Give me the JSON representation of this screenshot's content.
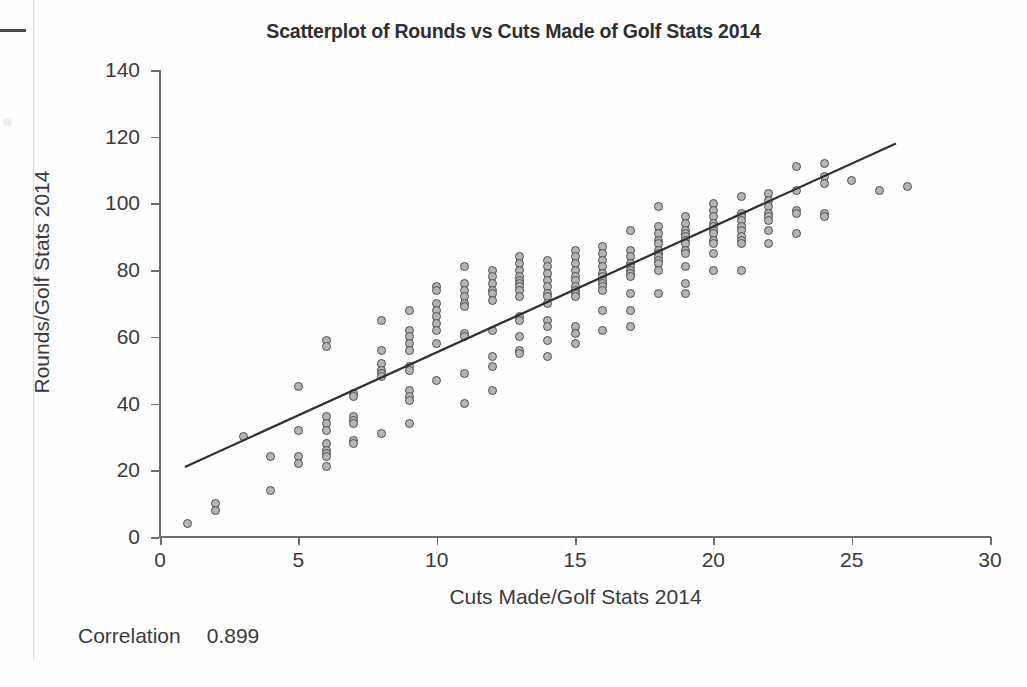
{
  "chart_data": {
    "type": "scatter",
    "title": "Scatterplot of Rounds vs Cuts Made of Golf Stats 2014",
    "xlabel": "Cuts Made/Golf Stats 2014",
    "ylabel": "Rounds/Golf Stats 2014",
    "xlim": [
      0,
      30
    ],
    "ylim": [
      0,
      140
    ],
    "xticks": [
      0,
      5,
      10,
      15,
      20,
      25,
      30
    ],
    "yticks": [
      0,
      20,
      40,
      60,
      80,
      100,
      120,
      140
    ],
    "grid": false,
    "legend": null,
    "marker": {
      "shape": "circle",
      "fill": "#b4b4b4",
      "stroke": "#4f4f4f",
      "size_px": 9
    },
    "fit_line": {
      "label": "regression line",
      "color": "#2f2f2f",
      "x_start": 0.9,
      "y_start": 21.0,
      "x_end": 26.6,
      "y_end": 118.0
    },
    "annotations": [
      {
        "label": "Correlation",
        "value": "0.899"
      }
    ],
    "points": [
      [
        1,
        4
      ],
      [
        2,
        10
      ],
      [
        2,
        8
      ],
      [
        3,
        30
      ],
      [
        4,
        24
      ],
      [
        4,
        14
      ],
      [
        5,
        45
      ],
      [
        5,
        32
      ],
      [
        5,
        24
      ],
      [
        5,
        22
      ],
      [
        6,
        59
      ],
      [
        6,
        57
      ],
      [
        6,
        36
      ],
      [
        6,
        34
      ],
      [
        6,
        32
      ],
      [
        6,
        28
      ],
      [
        6,
        26
      ],
      [
        6,
        25
      ],
      [
        6,
        24
      ],
      [
        6,
        21
      ],
      [
        7,
        43
      ],
      [
        7,
        42
      ],
      [
        7,
        36
      ],
      [
        7,
        35
      ],
      [
        7,
        34
      ],
      [
        7,
        29
      ],
      [
        7,
        28
      ],
      [
        8,
        65
      ],
      [
        8,
        56
      ],
      [
        8,
        52
      ],
      [
        8,
        50
      ],
      [
        8,
        49
      ],
      [
        8,
        48
      ],
      [
        8,
        31
      ],
      [
        9,
        68
      ],
      [
        9,
        62
      ],
      [
        9,
        60
      ],
      [
        9,
        58
      ],
      [
        9,
        56
      ],
      [
        9,
        51
      ],
      [
        9,
        50
      ],
      [
        9,
        44
      ],
      [
        9,
        42
      ],
      [
        9,
        41
      ],
      [
        9,
        34
      ],
      [
        10,
        75
      ],
      [
        10,
        74
      ],
      [
        10,
        70
      ],
      [
        10,
        68
      ],
      [
        10,
        66
      ],
      [
        10,
        64
      ],
      [
        10,
        62
      ],
      [
        10,
        58
      ],
      [
        10,
        47
      ],
      [
        11,
        81
      ],
      [
        11,
        76
      ],
      [
        11,
        74
      ],
      [
        11,
        72
      ],
      [
        11,
        70
      ],
      [
        11,
        69
      ],
      [
        11,
        61
      ],
      [
        11,
        60
      ],
      [
        11,
        49
      ],
      [
        11,
        40
      ],
      [
        12,
        80
      ],
      [
        12,
        78
      ],
      [
        12,
        76
      ],
      [
        12,
        74
      ],
      [
        12,
        73
      ],
      [
        12,
        71
      ],
      [
        12,
        62
      ],
      [
        12,
        54
      ],
      [
        12,
        51
      ],
      [
        12,
        44
      ],
      [
        13,
        84
      ],
      [
        13,
        82
      ],
      [
        13,
        80
      ],
      [
        13,
        78
      ],
      [
        13,
        77
      ],
      [
        13,
        76
      ],
      [
        13,
        75
      ],
      [
        13,
        74
      ],
      [
        13,
        72
      ],
      [
        13,
        66
      ],
      [
        13,
        65
      ],
      [
        13,
        60
      ],
      [
        13,
        56
      ],
      [
        13,
        55
      ],
      [
        14,
        83
      ],
      [
        14,
        81
      ],
      [
        14,
        79
      ],
      [
        14,
        77
      ],
      [
        14,
        75
      ],
      [
        14,
        73
      ],
      [
        14,
        72
      ],
      [
        14,
        70
      ],
      [
        14,
        65
      ],
      [
        14,
        63
      ],
      [
        14,
        59
      ],
      [
        14,
        54
      ],
      [
        15,
        86
      ],
      [
        15,
        84
      ],
      [
        15,
        82
      ],
      [
        15,
        80
      ],
      [
        15,
        78
      ],
      [
        15,
        77
      ],
      [
        15,
        75
      ],
      [
        15,
        74
      ],
      [
        15,
        73
      ],
      [
        15,
        72
      ],
      [
        15,
        63
      ],
      [
        15,
        61
      ],
      [
        15,
        58
      ],
      [
        16,
        87
      ],
      [
        16,
        85
      ],
      [
        16,
        83
      ],
      [
        16,
        81
      ],
      [
        16,
        79
      ],
      [
        16,
        78
      ],
      [
        16,
        77
      ],
      [
        16,
        76
      ],
      [
        16,
        75
      ],
      [
        16,
        74
      ],
      [
        16,
        68
      ],
      [
        16,
        62
      ],
      [
        17,
        92
      ],
      [
        17,
        86
      ],
      [
        17,
        84
      ],
      [
        17,
        82
      ],
      [
        17,
        81
      ],
      [
        17,
        80
      ],
      [
        17,
        79
      ],
      [
        17,
        78
      ],
      [
        17,
        73
      ],
      [
        17,
        68
      ],
      [
        17,
        63
      ],
      [
        18,
        99
      ],
      [
        18,
        93
      ],
      [
        18,
        91
      ],
      [
        18,
        89
      ],
      [
        18,
        88
      ],
      [
        18,
        86
      ],
      [
        18,
        85
      ],
      [
        18,
        84
      ],
      [
        18,
        83
      ],
      [
        18,
        82
      ],
      [
        18,
        80
      ],
      [
        18,
        73
      ],
      [
        19,
        96
      ],
      [
        19,
        94
      ],
      [
        19,
        92
      ],
      [
        19,
        91
      ],
      [
        19,
        90
      ],
      [
        19,
        89
      ],
      [
        19,
        88
      ],
      [
        19,
        86
      ],
      [
        19,
        85
      ],
      [
        19,
        81
      ],
      [
        19,
        76
      ],
      [
        19,
        73
      ],
      [
        20,
        100
      ],
      [
        20,
        98
      ],
      [
        20,
        96
      ],
      [
        20,
        94
      ],
      [
        20,
        93
      ],
      [
        20,
        92
      ],
      [
        20,
        91
      ],
      [
        20,
        89
      ],
      [
        20,
        88
      ],
      [
        20,
        85
      ],
      [
        20,
        80
      ],
      [
        21,
        102
      ],
      [
        21,
        97
      ],
      [
        21,
        96
      ],
      [
        21,
        95
      ],
      [
        21,
        93
      ],
      [
        21,
        92
      ],
      [
        21,
        90
      ],
      [
        21,
        89
      ],
      [
        21,
        88
      ],
      [
        21,
        80
      ],
      [
        22,
        103
      ],
      [
        22,
        101
      ],
      [
        22,
        99
      ],
      [
        22,
        97
      ],
      [
        22,
        96
      ],
      [
        22,
        95
      ],
      [
        22,
        92
      ],
      [
        22,
        88
      ],
      [
        23,
        111
      ],
      [
        23,
        104
      ],
      [
        23,
        98
      ],
      [
        23,
        97
      ],
      [
        23,
        91
      ],
      [
        24,
        112
      ],
      [
        24,
        108
      ],
      [
        24,
        106
      ],
      [
        24,
        97
      ],
      [
        24,
        96
      ],
      [
        25,
        107
      ],
      [
        26,
        104
      ],
      [
        27,
        105
      ]
    ]
  },
  "scan": {
    "top_mark": "scan-mark",
    "page_edge": "page-edge-line"
  }
}
